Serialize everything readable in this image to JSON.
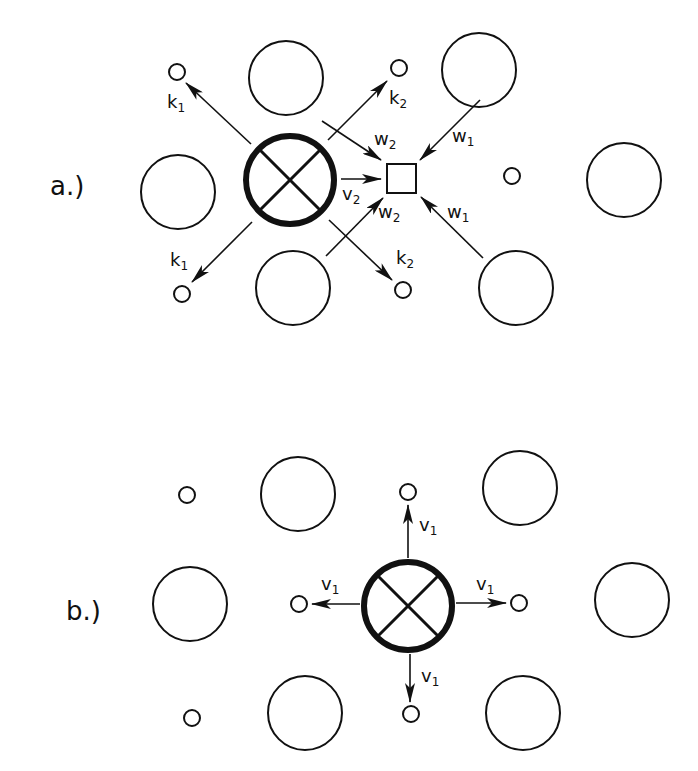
{
  "colors": {
    "ink": "#111111",
    "background": "#ffffff"
  },
  "panels": {
    "a": {
      "label": "a.)",
      "arrow_labels": {
        "k1_upper": {
          "main": "k",
          "sub": "1"
        },
        "k1_lower": {
          "main": "k",
          "sub": "1"
        },
        "k2_upper": {
          "main": "k",
          "sub": "2"
        },
        "k2_lower": {
          "main": "k",
          "sub": "2"
        },
        "w2_upper": {
          "main": "w",
          "sub": "2"
        },
        "w2_lower": {
          "main": "w",
          "sub": "2"
        },
        "w1_upper": {
          "main": "w",
          "sub": "1"
        },
        "w1_lower": {
          "main": "w",
          "sub": "1"
        },
        "v2": {
          "main": "v",
          "sub": "2"
        }
      }
    },
    "b": {
      "label": "b.)",
      "arrow_labels": {
        "v1_up": {
          "main": "v",
          "sub": "1"
        },
        "v1_left": {
          "main": "v",
          "sub": "1"
        },
        "v1_right": {
          "main": "v",
          "sub": "1"
        },
        "v1_down": {
          "main": "v",
          "sub": "1"
        }
      }
    }
  }
}
